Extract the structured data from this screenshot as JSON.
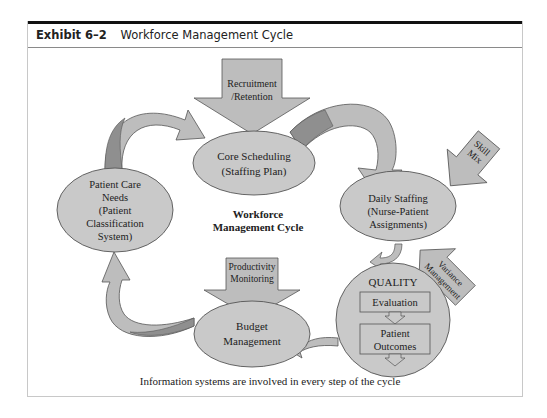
{
  "exhibit": {
    "label": "Exhibit 6–2",
    "title": "Workforce Management Cycle"
  },
  "center_title": {
    "line1": "Workforce",
    "line2": "Management Cycle"
  },
  "nodes": {
    "core_scheduling": {
      "line1": "Core Scheduling",
      "line2": "(Staffing Plan)"
    },
    "patient_care_needs": {
      "line1": "Patient Care",
      "line2": "Needs",
      "line3": "(Patient",
      "line4": "Classification",
      "line5": "System)"
    },
    "daily_staffing": {
      "line1": "Daily Staffing",
      "line2": "(Nurse-Patient",
      "line3": "Assignments)"
    },
    "quality": {
      "title": "QUALITY",
      "evaluation": "Evaluation",
      "outcomes_line1": "Patient",
      "outcomes_line2": "Outcomes"
    },
    "budget_management": {
      "line1": "Budget",
      "line2": "Management"
    }
  },
  "inputs": {
    "recruitment": {
      "line1": "Recruitment",
      "line2": "/Retention"
    },
    "skill_mix": {
      "line1": "Skill",
      "line2": "Mix"
    },
    "variance": {
      "line1": "Variance",
      "line2": "Management"
    },
    "productivity": {
      "line1": "Productivity",
      "line2": "Monitoring"
    }
  },
  "footer_note": "Information systems are involved in every step of the cycle",
  "colors": {
    "node_fill": "#c9c9c9",
    "arrow_fill": "#bdbdbd",
    "arrow_dark": "#8f8f8f",
    "stroke": "#555555"
  }
}
